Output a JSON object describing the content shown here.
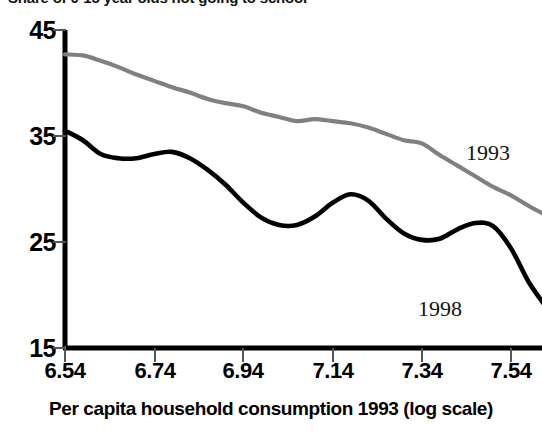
{
  "chart_data": {
    "type": "line",
    "title": "Share of 0-15 year olds not going to school",
    "xlabel": "Per capita household consumption 1993 (log scale)",
    "ylabel": "",
    "xlim": [
      6.54,
      7.64
    ],
    "ylim": [
      15,
      45
    ],
    "xticks": [
      "6.54",
      "6.74",
      "6.94",
      "7.14",
      "7.34",
      "7.54"
    ],
    "xtick_values": [
      6.54,
      6.74,
      6.94,
      7.14,
      7.34,
      7.54
    ],
    "yticks": [
      "45",
      "35",
      "25",
      "15"
    ],
    "ytick_values": [
      45,
      35,
      25,
      15
    ],
    "grid": false,
    "legend_position": "inline-annotation",
    "series": [
      {
        "name": "1993",
        "color": "#808080",
        "annotation": "1993",
        "x": [
          6.54,
          6.58,
          6.62,
          6.66,
          6.7,
          6.74,
          6.78,
          6.82,
          6.86,
          6.9,
          6.94,
          6.98,
          7.02,
          7.06,
          7.1,
          7.14,
          7.18,
          7.22,
          7.26,
          7.3,
          7.34,
          7.38,
          7.42,
          7.46,
          7.5,
          7.54,
          7.58,
          7.62
        ],
        "values": [
          42.7,
          42.6,
          42.1,
          41.5,
          40.8,
          40.2,
          39.6,
          39.1,
          38.5,
          38.1,
          37.8,
          37.2,
          36.8,
          36.4,
          36.6,
          36.4,
          36.2,
          35.8,
          35.2,
          34.6,
          34.3,
          33.2,
          32.2,
          31.2,
          30.2,
          29.4,
          28.4,
          27.5
        ]
      },
      {
        "name": "1998",
        "color": "#000000",
        "annotation": "1998",
        "x": [
          6.54,
          6.58,
          6.62,
          6.66,
          6.7,
          6.74,
          6.78,
          6.82,
          6.86,
          6.9,
          6.94,
          6.98,
          7.02,
          7.06,
          7.1,
          7.14,
          7.18,
          7.22,
          7.26,
          7.3,
          7.34,
          7.38,
          7.42,
          7.46,
          7.5,
          7.54,
          7.58,
          7.62
        ],
        "values": [
          35.5,
          34.6,
          33.3,
          32.9,
          32.9,
          33.3,
          33.5,
          32.9,
          31.8,
          30.4,
          28.7,
          27.3,
          26.6,
          26.6,
          27.4,
          28.7,
          29.5,
          28.9,
          27.2,
          25.8,
          25.2,
          25.3,
          26.2,
          26.8,
          26.5,
          24.4,
          21.2,
          18.8
        ]
      }
    ]
  },
  "axis": {
    "axis_color": "#000000",
    "tick_color": "#555555"
  }
}
